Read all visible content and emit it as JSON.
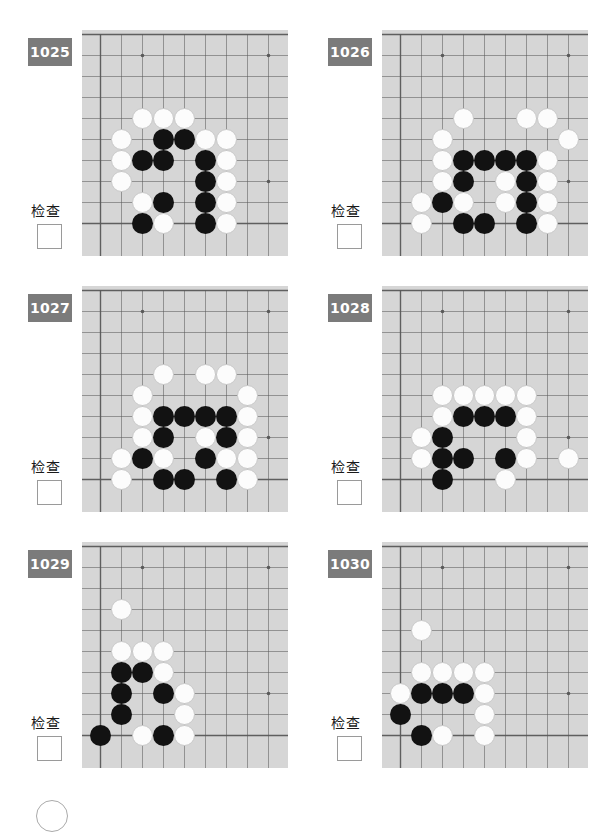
{
  "page": {
    "background_color": "#ffffff",
    "board_color": "#d6d6d6",
    "grid_color": "#595959",
    "badge_color": "#7b7b7b",
    "black_stone_color": "#121212",
    "white_stone_color": "#fcfcfc"
  },
  "board_spec": {
    "cell": 21,
    "cols": 9,
    "rows": 9,
    "origin_x": 18,
    "origin_y": 4,
    "star_points": [
      [
        2,
        1
      ],
      [
        8,
        1
      ],
      [
        8,
        7
      ]
    ]
  },
  "problems": [
    {
      "number": "1025",
      "check_label": "检查",
      "checkbox_checked": false,
      "stones": [
        {
          "c": "w",
          "x": 2,
          "y": 4
        },
        {
          "c": "w",
          "x": 3,
          "y": 4
        },
        {
          "c": "w",
          "x": 4,
          "y": 4
        },
        {
          "c": "w",
          "x": 1,
          "y": 5
        },
        {
          "c": "b",
          "x": 3,
          "y": 5
        },
        {
          "c": "b",
          "x": 4,
          "y": 5
        },
        {
          "c": "w",
          "x": 5,
          "y": 5
        },
        {
          "c": "w",
          "x": 6,
          "y": 5
        },
        {
          "c": "w",
          "x": 1,
          "y": 6
        },
        {
          "c": "b",
          "x": 2,
          "y": 6
        },
        {
          "c": "b",
          "x": 3,
          "y": 6
        },
        {
          "c": "b",
          "x": 5,
          "y": 6
        },
        {
          "c": "w",
          "x": 6,
          "y": 6
        },
        {
          "c": "w",
          "x": 1,
          "y": 7
        },
        {
          "c": "b",
          "x": 5,
          "y": 7
        },
        {
          "c": "w",
          "x": 6,
          "y": 7
        },
        {
          "c": "w",
          "x": 2,
          "y": 8
        },
        {
          "c": "b",
          "x": 3,
          "y": 8
        },
        {
          "c": "b",
          "x": 5,
          "y": 8
        },
        {
          "c": "w",
          "x": 6,
          "y": 8
        },
        {
          "c": "b",
          "x": 2,
          "y": 9
        },
        {
          "c": "w",
          "x": 3,
          "y": 9
        },
        {
          "c": "b",
          "x": 5,
          "y": 9
        },
        {
          "c": "w",
          "x": 6,
          "y": 9
        }
      ]
    },
    {
      "number": "1026",
      "check_label": "检查",
      "checkbox_checked": false,
      "stones": [
        {
          "c": "w",
          "x": 3,
          "y": 4
        },
        {
          "c": "w",
          "x": 6,
          "y": 4
        },
        {
          "c": "w",
          "x": 7,
          "y": 4
        },
        {
          "c": "w",
          "x": 2,
          "y": 5
        },
        {
          "c": "w",
          "x": 8,
          "y": 5
        },
        {
          "c": "w",
          "x": 2,
          "y": 6
        },
        {
          "c": "b",
          "x": 3,
          "y": 6
        },
        {
          "c": "b",
          "x": 4,
          "y": 6
        },
        {
          "c": "b",
          "x": 5,
          "y": 6
        },
        {
          "c": "b",
          "x": 6,
          "y": 6
        },
        {
          "c": "w",
          "x": 7,
          "y": 6
        },
        {
          "c": "w",
          "x": 2,
          "y": 7
        },
        {
          "c": "b",
          "x": 3,
          "y": 7
        },
        {
          "c": "w",
          "x": 5,
          "y": 7
        },
        {
          "c": "b",
          "x": 6,
          "y": 7
        },
        {
          "c": "w",
          "x": 7,
          "y": 7
        },
        {
          "c": "w",
          "x": 1,
          "y": 8
        },
        {
          "c": "b",
          "x": 2,
          "y": 8
        },
        {
          "c": "w",
          "x": 3,
          "y": 8
        },
        {
          "c": "w",
          "x": 5,
          "y": 8
        },
        {
          "c": "b",
          "x": 6,
          "y": 8
        },
        {
          "c": "w",
          "x": 7,
          "y": 8
        },
        {
          "c": "w",
          "x": 1,
          "y": 9
        },
        {
          "c": "b",
          "x": 3,
          "y": 9
        },
        {
          "c": "b",
          "x": 4,
          "y": 9
        },
        {
          "c": "b",
          "x": 6,
          "y": 9
        },
        {
          "c": "w",
          "x": 7,
          "y": 9
        }
      ]
    },
    {
      "number": "1027",
      "check_label": "检查",
      "checkbox_checked": false,
      "stones": [
        {
          "c": "w",
          "x": 3,
          "y": 4
        },
        {
          "c": "w",
          "x": 5,
          "y": 4
        },
        {
          "c": "w",
          "x": 6,
          "y": 4
        },
        {
          "c": "w",
          "x": 2,
          "y": 5
        },
        {
          "c": "w",
          "x": 7,
          "y": 5
        },
        {
          "c": "w",
          "x": 2,
          "y": 6
        },
        {
          "c": "b",
          "x": 3,
          "y": 6
        },
        {
          "c": "b",
          "x": 4,
          "y": 6
        },
        {
          "c": "b",
          "x": 5,
          "y": 6
        },
        {
          "c": "b",
          "x": 6,
          "y": 6
        },
        {
          "c": "w",
          "x": 7,
          "y": 6
        },
        {
          "c": "w",
          "x": 2,
          "y": 7
        },
        {
          "c": "b",
          "x": 3,
          "y": 7
        },
        {
          "c": "w",
          "x": 5,
          "y": 7
        },
        {
          "c": "b",
          "x": 6,
          "y": 7
        },
        {
          "c": "w",
          "x": 7,
          "y": 7
        },
        {
          "c": "w",
          "x": 1,
          "y": 8
        },
        {
          "c": "b",
          "x": 2,
          "y": 8
        },
        {
          "c": "w",
          "x": 3,
          "y": 8
        },
        {
          "c": "b",
          "x": 5,
          "y": 8
        },
        {
          "c": "w",
          "x": 6,
          "y": 8
        },
        {
          "c": "w",
          "x": 7,
          "y": 8
        },
        {
          "c": "w",
          "x": 1,
          "y": 9
        },
        {
          "c": "b",
          "x": 3,
          "y": 9
        },
        {
          "c": "b",
          "x": 4,
          "y": 9
        },
        {
          "c": "b",
          "x": 6,
          "y": 9
        },
        {
          "c": "w",
          "x": 7,
          "y": 9
        }
      ]
    },
    {
      "number": "1028",
      "check_label": "检查",
      "checkbox_checked": false,
      "stones": [
        {
          "c": "w",
          "x": 2,
          "y": 5
        },
        {
          "c": "w",
          "x": 3,
          "y": 5
        },
        {
          "c": "w",
          "x": 4,
          "y": 5
        },
        {
          "c": "w",
          "x": 5,
          "y": 5
        },
        {
          "c": "w",
          "x": 6,
          "y": 5
        },
        {
          "c": "w",
          "x": 2,
          "y": 6
        },
        {
          "c": "b",
          "x": 3,
          "y": 6
        },
        {
          "c": "b",
          "x": 4,
          "y": 6
        },
        {
          "c": "b",
          "x": 5,
          "y": 6
        },
        {
          "c": "w",
          "x": 6,
          "y": 6
        },
        {
          "c": "w",
          "x": 1,
          "y": 7
        },
        {
          "c": "b",
          "x": 2,
          "y": 7
        },
        {
          "c": "w",
          "x": 6,
          "y": 7
        },
        {
          "c": "w",
          "x": 1,
          "y": 8
        },
        {
          "c": "b",
          "x": 2,
          "y": 8
        },
        {
          "c": "b",
          "x": 3,
          "y": 8
        },
        {
          "c": "b",
          "x": 5,
          "y": 8
        },
        {
          "c": "w",
          "x": 6,
          "y": 8
        },
        {
          "c": "w",
          "x": 8,
          "y": 8
        },
        {
          "c": "b",
          "x": 2,
          "y": 9
        },
        {
          "c": "w",
          "x": 5,
          "y": 9
        }
      ]
    },
    {
      "number": "1029",
      "check_label": "检查",
      "checkbox_checked": false,
      "stones": [
        {
          "c": "w",
          "x": 1,
          "y": 3
        },
        {
          "c": "w",
          "x": 1,
          "y": 5
        },
        {
          "c": "w",
          "x": 2,
          "y": 5
        },
        {
          "c": "w",
          "x": 3,
          "y": 5
        },
        {
          "c": "b",
          "x": 1,
          "y": 6
        },
        {
          "c": "b",
          "x": 2,
          "y": 6
        },
        {
          "c": "w",
          "x": 3,
          "y": 6
        },
        {
          "c": "b",
          "x": 1,
          "y": 7
        },
        {
          "c": "b",
          "x": 3,
          "y": 7
        },
        {
          "c": "w",
          "x": 4,
          "y": 7
        },
        {
          "c": "b",
          "x": 1,
          "y": 8
        },
        {
          "c": "w",
          "x": 4,
          "y": 8
        },
        {
          "c": "b",
          "x": 0,
          "y": 9
        },
        {
          "c": "w",
          "x": 2,
          "y": 9
        },
        {
          "c": "b",
          "x": 3,
          "y": 9
        },
        {
          "c": "w",
          "x": 4,
          "y": 9
        }
      ]
    },
    {
      "number": "1030",
      "check_label": "检查",
      "checkbox_checked": false,
      "stones": [
        {
          "c": "w",
          "x": 1,
          "y": 4
        },
        {
          "c": "w",
          "x": 1,
          "y": 6
        },
        {
          "c": "w",
          "x": 2,
          "y": 6
        },
        {
          "c": "w",
          "x": 3,
          "y": 6
        },
        {
          "c": "w",
          "x": 4,
          "y": 6
        },
        {
          "c": "w",
          "x": 0,
          "y": 7
        },
        {
          "c": "b",
          "x": 1,
          "y": 7
        },
        {
          "c": "b",
          "x": 2,
          "y": 7
        },
        {
          "c": "b",
          "x": 3,
          "y": 7
        },
        {
          "c": "w",
          "x": 4,
          "y": 7
        },
        {
          "c": "b",
          "x": 0,
          "y": 8
        },
        {
          "c": "w",
          "x": 4,
          "y": 8
        },
        {
          "c": "b",
          "x": 1,
          "y": 9
        },
        {
          "c": "w",
          "x": 2,
          "y": 9
        },
        {
          "c": "w",
          "x": 4,
          "y": 9
        }
      ]
    }
  ],
  "grid_positions": [
    {
      "left": 0,
      "top": 30
    },
    {
      "left": 300,
      "top": 30
    },
    {
      "left": 0,
      "top": 286
    },
    {
      "left": 300,
      "top": 286
    },
    {
      "left": 0,
      "top": 542
    },
    {
      "left": 300,
      "top": 542
    }
  ]
}
